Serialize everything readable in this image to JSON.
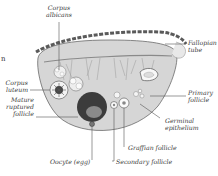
{
  "diagram": {
    "labels": {
      "corpus_albicans": [
        "Corpus",
        "albicans"
      ],
      "fallopian_tube": [
        "Fallopian",
        "tube"
      ],
      "corpus_luteum": [
        "Corpus",
        "luteum"
      ],
      "mature_ruptured_follicle": [
        "Mature",
        "ruptured",
        "follicle"
      ],
      "primary_follicle": [
        "Primary",
        "follicle"
      ],
      "germinal_epithelium": [
        "Germinal",
        "epithelium"
      ],
      "graafian_follicle": "Graffian follicle",
      "secondary_follicle": "Secondary follicle",
      "oocyte": "Oocyte (egg)"
    },
    "edge_fragment": "n",
    "colors": {
      "text": "#3a3a3a",
      "line": "#555555",
      "tissue": "#c8c8c8",
      "dark": "#3c3c3c"
    }
  }
}
